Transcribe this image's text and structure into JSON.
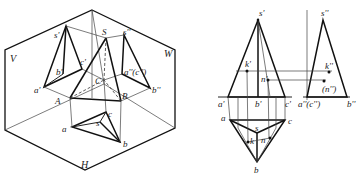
{
  "left_figure": {
    "description": "Axonometric view of triangular pyramid SABC projected onto V, H, W planes",
    "plane_labels": {
      "V": "V",
      "W": "W",
      "H": "H"
    },
    "vertex_labels": {
      "S": "S",
      "A": "A",
      "B": "B",
      "C": "C"
    },
    "v_projection_labels": {
      "s": "s'",
      "a": "a'",
      "b": "b'",
      "c": "c'"
    },
    "w_projection_labels": {
      "s": "s''",
      "ac": "a''(c'')",
      "b": "b''"
    },
    "h_projection_labels": {
      "s": "s",
      "a": "a",
      "b": "b",
      "c": "c"
    }
  },
  "right_figure": {
    "description": "Orthographic three-view projection with points K and N on pyramid faces",
    "front_view_labels": {
      "s": "s'",
      "a": "a'",
      "b": "b'",
      "c": "c'",
      "k": "k'",
      "n": "n'"
    },
    "side_view_labels": {
      "s": "s''",
      "ac": "a''(c'')",
      "b": "b''",
      "k": "k''",
      "n": "(n'')"
    },
    "top_view_labels": {
      "s": "s",
      "a": "a",
      "b": "b",
      "c": "c",
      "k": "k",
      "n": "n"
    }
  }
}
